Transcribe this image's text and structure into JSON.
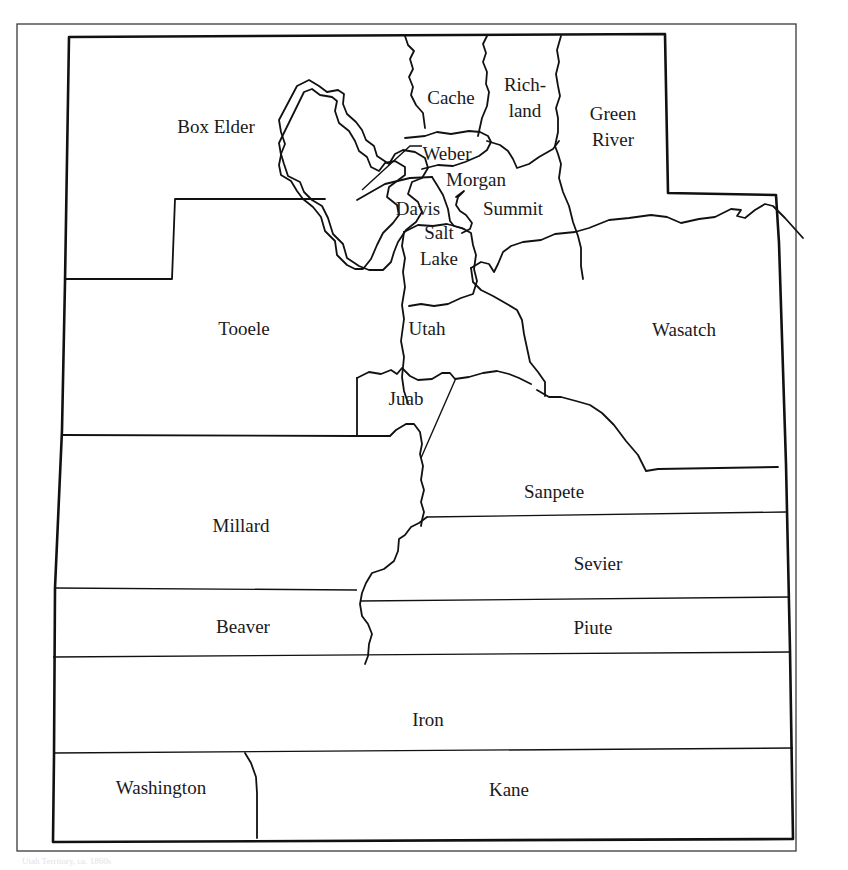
{
  "map": {
    "title": "Utah counties (historical boundaries)",
    "counties": [
      {
        "name": "Box Elder",
        "x": 216,
        "y": 127,
        "lines": [
          "Box Elder"
        ]
      },
      {
        "name": "Cache",
        "x": 451,
        "y": 98,
        "lines": [
          "Cache"
        ]
      },
      {
        "name": "Richland",
        "x": 525,
        "y": 98,
        "lines": [
          "Rich-",
          "land"
        ]
      },
      {
        "name": "Green River",
        "x": 613,
        "y": 127,
        "lines": [
          "Green",
          "River"
        ]
      },
      {
        "name": "Weber",
        "x": 447,
        "y": 154,
        "lines": [
          "Weber"
        ]
      },
      {
        "name": "Morgan",
        "x": 476,
        "y": 180,
        "lines": [
          "Morgan"
        ]
      },
      {
        "name": "Davis",
        "x": 418,
        "y": 209,
        "lines": [
          "Davis"
        ]
      },
      {
        "name": "Summit",
        "x": 513,
        "y": 209,
        "lines": [
          "Summit"
        ]
      },
      {
        "name": "Salt Lake",
        "x": 439,
        "y": 246,
        "lines": [
          "Salt",
          "Lake"
        ]
      },
      {
        "name": "Tooele",
        "x": 244,
        "y": 329,
        "lines": [
          "Tooele"
        ]
      },
      {
        "name": "Utah",
        "x": 427,
        "y": 329,
        "lines": [
          "Utah"
        ]
      },
      {
        "name": "Wasatch",
        "x": 684,
        "y": 330,
        "lines": [
          "Wasatch"
        ]
      },
      {
        "name": "Juab",
        "x": 406,
        "y": 399,
        "lines": [
          "Juab"
        ]
      },
      {
        "name": "Sanpete",
        "x": 554,
        "y": 492,
        "lines": [
          "Sanpete"
        ]
      },
      {
        "name": "Millard",
        "x": 241,
        "y": 526,
        "lines": [
          "Millard"
        ]
      },
      {
        "name": "Sevier",
        "x": 598,
        "y": 564,
        "lines": [
          "Sevier"
        ]
      },
      {
        "name": "Beaver",
        "x": 243,
        "y": 627,
        "lines": [
          "Beaver"
        ]
      },
      {
        "name": "Piute",
        "x": 593,
        "y": 628,
        "lines": [
          "Piute"
        ]
      },
      {
        "name": "Iron",
        "x": 428,
        "y": 720,
        "lines": [
          "Iron"
        ]
      },
      {
        "name": "Washington",
        "x": 161,
        "y": 788,
        "lines": [
          "Washington"
        ]
      },
      {
        "name": "Kane",
        "x": 509,
        "y": 790,
        "lines": [
          "Kane"
        ]
      }
    ],
    "caption": "Utah Territory, ca. 1860s"
  }
}
